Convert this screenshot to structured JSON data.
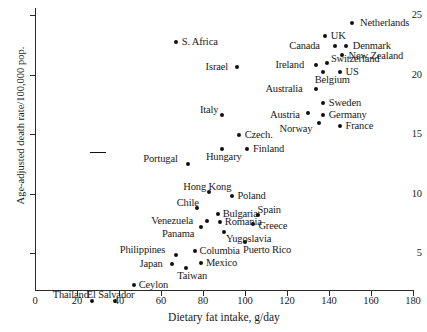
{
  "chart_data": {
    "type": "scatter",
    "title": "",
    "xlabel": "Dietary fat intake, g/day",
    "ylabel": "Age-adjusted death rate/100,000 pop.",
    "xlim": [
      0,
      180
    ],
    "ylim": [
      0,
      26
    ],
    "xticks": [
      0,
      20,
      40,
      60,
      80,
      100,
      120,
      140,
      160,
      180
    ],
    "yticks": [
      5,
      10,
      15,
      20,
      25
    ],
    "grid": false,
    "legend": null,
    "points": [
      {
        "label": "Netherlands",
        "x": 151,
        "y": 24.3,
        "lx": 8,
        "ly": -6
      },
      {
        "label": "UK",
        "x": 138,
        "y": 23.2,
        "lx": 6,
        "ly": -6
      },
      {
        "label": "Denmark",
        "x": 148,
        "y": 22.4,
        "lx": 7,
        "ly": -6
      },
      {
        "label": "Canada",
        "x": 143,
        "y": 22.4,
        "lx": -46,
        "ly": -6
      },
      {
        "label": "New Zealand",
        "x": 146,
        "y": 21.6,
        "lx": 7,
        "ly": -5
      },
      {
        "label": "Switzerland",
        "x": 139,
        "y": 21.0,
        "lx": 4,
        "ly": -10
      },
      {
        "label": "Ireland",
        "x": 134,
        "y": 20.8,
        "lx": -41,
        "ly": -6
      },
      {
        "label": "Belgium",
        "x": 137,
        "y": 20.2,
        "lx": -8,
        "ly": 2
      },
      {
        "label": "US",
        "x": 145,
        "y": 20.2,
        "lx": 6,
        "ly": -6
      },
      {
        "label": "S. Africa",
        "x": 67,
        "y": 22.7,
        "lx": 6,
        "ly": -6
      },
      {
        "label": "Israel",
        "x": 96,
        "y": 20.6,
        "lx": -31,
        "ly": -6
      },
      {
        "label": "Australia",
        "x": 134,
        "y": 18.8,
        "lx": -51,
        "ly": -6
      },
      {
        "label": "Sweden",
        "x": 137,
        "y": 17.6,
        "lx": 6,
        "ly": -6
      },
      {
        "label": "Austria",
        "x": 130,
        "y": 16.8,
        "lx": -38,
        "ly": -4
      },
      {
        "label": "Germany",
        "x": 137,
        "y": 16.6,
        "lx": 6,
        "ly": -6
      },
      {
        "label": "Norway",
        "x": 135,
        "y": 15.9,
        "lx": -39,
        "ly": 0
      },
      {
        "label": "France",
        "x": 145,
        "y": 15.7,
        "lx": 6,
        "ly": -6
      },
      {
        "label": "Italy",
        "x": 89,
        "y": 16.6,
        "lx": -22,
        "ly": -11
      },
      {
        "label": "Czech.",
        "x": 97,
        "y": 14.9,
        "lx": 6,
        "ly": -6
      },
      {
        "label": "Finland",
        "x": 101,
        "y": 13.7,
        "lx": 6,
        "ly": -6
      },
      {
        "label": "Hungary",
        "x": 89,
        "y": 13.7,
        "lx": -16,
        "ly": 2
      },
      {
        "label": "Portugal",
        "x": 73,
        "y": 12.5,
        "lx": -45,
        "ly": -11
      },
      {
        "label": "Hong Kong",
        "x": 83,
        "y": 10.1,
        "lx": -26,
        "ly": -11
      },
      {
        "label": "Poland",
        "x": 94,
        "y": 9.8,
        "lx": 5,
        "ly": -6
      },
      {
        "label": "Chile",
        "x": 77,
        "y": 8.8,
        "lx": -20,
        "ly": -11
      },
      {
        "label": "Bulgaria",
        "x": 87,
        "y": 8.3,
        "lx": 5,
        "ly": -6
      },
      {
        "label": "Spain",
        "x": 106,
        "y": 8.2,
        "lx": 0,
        "ly": -11
      },
      {
        "label": "Venezuela",
        "x": 82,
        "y": 7.7,
        "lx": -56,
        "ly": -6
      },
      {
        "label": "Romania",
        "x": 88,
        "y": 7.6,
        "lx": 5,
        "ly": -6
      },
      {
        "label": "Greece",
        "x": 104,
        "y": 7.4,
        "lx": 5,
        "ly": -4
      },
      {
        "label": "Panama",
        "x": 79,
        "y": 7.2,
        "lx": -39,
        "ly": 1
      },
      {
        "label": "Yugoslavia",
        "x": 90,
        "y": 6.8,
        "lx": 2,
        "ly": 1
      },
      {
        "label": "Puerto Rico",
        "x": 100,
        "y": 5.9,
        "lx": -2,
        "ly": 2
      },
      {
        "label": "Columbia",
        "x": 76,
        "y": 5.2,
        "lx": 5,
        "ly": -6
      },
      {
        "label": "Philippines",
        "x": 67,
        "y": 4.8,
        "lx": -56,
        "ly": -11
      },
      {
        "label": "Mexico",
        "x": 79,
        "y": 4.2,
        "lx": 5,
        "ly": -6
      },
      {
        "label": "Japan",
        "x": 65,
        "y": 4.1,
        "lx": -32,
        "ly": -6
      },
      {
        "label": "Taiwan",
        "x": 72,
        "y": 3.7,
        "lx": -9,
        "ly": 2
      },
      {
        "label": "Ceylon",
        "x": 47,
        "y": 2.3,
        "lx": 5,
        "ly": -6
      },
      {
        "label": "El Salvador",
        "x": 38,
        "y": 1.0,
        "lx": -28,
        "ly": -12
      },
      {
        "label": "Thailand",
        "x": 27,
        "y": 1.0,
        "lx": -39,
        "ly": -12
      }
    ],
    "leader_lines": [
      {
        "from_x": 90,
        "to_x": 106,
        "at_y": 152
      }
    ]
  },
  "caption": {
    "text": ""
  }
}
